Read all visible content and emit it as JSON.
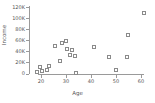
{
  "chart_data": {
    "type": "scatter",
    "title": "",
    "xlabel": "Age",
    "ylabel": "Income",
    "xlim": [
      16,
      64
    ],
    "ylim": [
      0,
      120000
    ],
    "grid": false,
    "legend": null,
    "x_ticks": [
      {
        "value": 20,
        "label": "20"
      },
      {
        "value": 30,
        "label": "30"
      },
      {
        "value": 40,
        "label": "40"
      },
      {
        "value": 50,
        "label": "50"
      },
      {
        "value": 60,
        "label": "60"
      }
    ],
    "y_ticks": [
      {
        "value": 0,
        "label": "0"
      },
      {
        "value": 20000,
        "label": "20K"
      },
      {
        "value": 40000,
        "label": "40K"
      },
      {
        "value": 60000,
        "label": "60K"
      },
      {
        "value": 80000,
        "label": "80K"
      },
      {
        "value": 100000,
        "label": "100K"
      },
      {
        "value": 120000,
        "label": "120K"
      }
    ],
    "marker": {
      "shape": "square-open",
      "color": "#8a8a8a",
      "size": 3
    },
    "points": [
      {
        "x": 18.5,
        "y": 2000
      },
      {
        "x": 19.5,
        "y": 11000
      },
      {
        "x": 20.5,
        "y": 5000
      },
      {
        "x": 22.5,
        "y": 6000
      },
      {
        "x": 23.0,
        "y": 14000
      },
      {
        "x": 25.5,
        "y": 50000
      },
      {
        "x": 27.5,
        "y": 22000
      },
      {
        "x": 28.5,
        "y": 55000
      },
      {
        "x": 30.0,
        "y": 58000
      },
      {
        "x": 30.5,
        "y": 45000
      },
      {
        "x": 31.5,
        "y": 33000
      },
      {
        "x": 32.5,
        "y": 42000
      },
      {
        "x": 33.5,
        "y": 31000
      },
      {
        "x": 34.0,
        "y": 1500
      },
      {
        "x": 41.0,
        "y": 47000
      },
      {
        "x": 47.0,
        "y": 30000
      },
      {
        "x": 50.0,
        "y": 7000
      },
      {
        "x": 54.5,
        "y": 29000
      },
      {
        "x": 54.8,
        "y": 69000
      },
      {
        "x": 61.0,
        "y": 110000
      }
    ]
  }
}
